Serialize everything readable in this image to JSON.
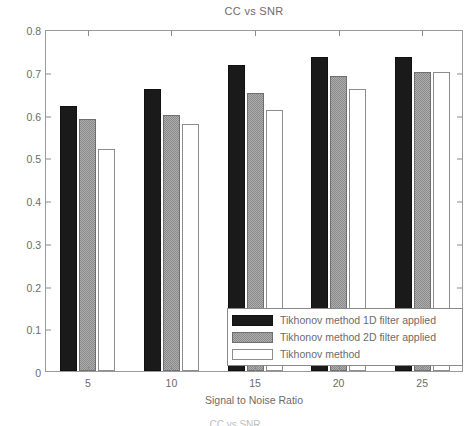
{
  "chart_data": {
    "type": "bar",
    "title": "CC vs SNR",
    "xlabel": "Signal to Noise Ratio",
    "ylabel": "Average Correlation Coefficient",
    "categories": [
      "5",
      "10",
      "15",
      "20",
      "25"
    ],
    "ylim": [
      0,
      0.8
    ],
    "y_ticks": [
      "0",
      "0.1",
      "0.2",
      "0.3",
      "0.4",
      "0.5",
      "0.6",
      "0.7",
      "0.8"
    ],
    "y_tick_values": [
      0,
      0.1,
      0.2,
      0.3,
      0.4,
      0.5,
      0.6,
      0.7,
      0.8
    ],
    "grid": false,
    "legend_position": "lower right",
    "series": [
      {
        "name": "Tikhonov method 1D filter applied",
        "color": "#1a1a1a",
        "values": [
          0.62,
          0.66,
          0.715,
          0.735,
          0.735
        ]
      },
      {
        "name": "Tikhonov method 2D filter applied",
        "color": "#8a8a8a",
        "values": [
          0.59,
          0.6,
          0.65,
          0.69,
          0.7
        ]
      },
      {
        "name": "Tikhonov method",
        "color": "#ffffff",
        "values": [
          0.52,
          0.578,
          0.61,
          0.66,
          0.7
        ]
      }
    ]
  },
  "footer": {
    "clipped_caption": "CC vs SNR"
  }
}
